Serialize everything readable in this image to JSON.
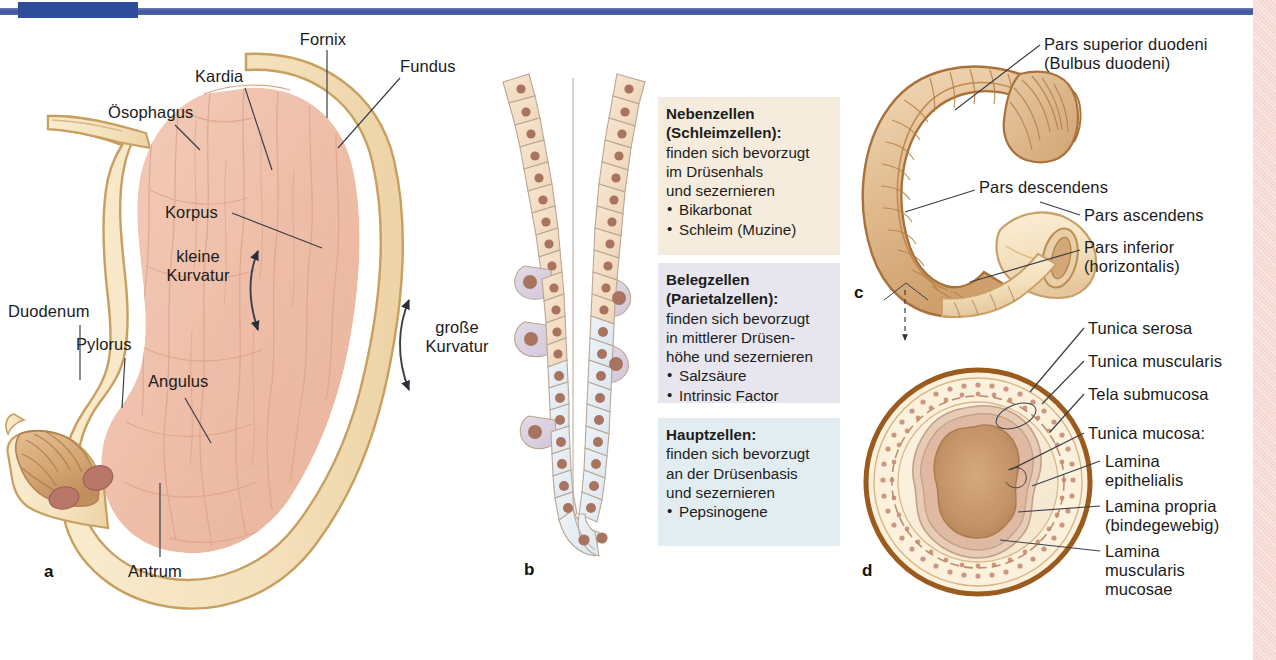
{
  "theme": {
    "header_bar_color": "#3d559c",
    "header_block_color": "#2f4c9a",
    "right_strip_color": "#f6d8d2",
    "wall_color": "#f6e3c2",
    "wall_outline": "#c8a163",
    "mucosa_color": "#f0c3ae",
    "duodenum_color": "#e0b488",
    "nebenzellen_box": "#f6ecdd",
    "belegzellen_box": "#e7e6ef",
    "hauptzellen_box": "#e2edf2",
    "chief_cell_fill": "#e6eef3",
    "parietal_cell_fill": "#ded7e4",
    "mucous_cell_fill": "#f5e0ca",
    "nucleus_color": "#a9745f",
    "serosa_brown": "#9b5a1e",
    "leader_color": "#3a3f4a"
  },
  "panel_a": {
    "letter": "a",
    "labels": {
      "fornix": "Fornix",
      "fundus": "Fundus",
      "kardia": "Kardia",
      "oesophagus": "Ösophagus",
      "korpus": "Korpus",
      "kleine_kurvatur": "kleine\nKurvatur",
      "grosse_kurvatur": "große\nKurvatur",
      "duodenum": "Duodenum",
      "pylorus": "Pylorus",
      "angulus": "Angulus",
      "antrum": "Antrum"
    }
  },
  "panel_b": {
    "letter": "b",
    "boxes": [
      {
        "id": "nebenzellen",
        "title": "Nebenzellen\n(Schleimzellen):",
        "body": "finden sich bevorzugt\nim Drüsenhals\nund sezernieren",
        "bullets": [
          "Bikarbonat",
          "Schleim (Muzine)"
        ],
        "bg": "#f6ecdd"
      },
      {
        "id": "belegzellen",
        "title": "Belegzellen\n(Parietalzellen):",
        "body": "finden sich bevorzugt\nin mittlerer Drüsen-\nhöhe und sezernieren",
        "bullets": [
          "Salzsäure",
          "Intrinsic Factor"
        ],
        "bg": "#e7e6ef"
      },
      {
        "id": "hauptzellen",
        "title": "Hauptzellen:",
        "body": "finden sich bevorzugt\nan der Drüsenbasis\nund sezernieren",
        "bullets": [
          "Pepsinogene"
        ],
        "bg": "#e2edf2"
      }
    ]
  },
  "panel_c": {
    "letter": "c",
    "labels": {
      "pars_superior": "Pars superior duodeni\n(Bulbus duodeni)",
      "pars_descendens": "Pars descendens",
      "pars_ascendens": "Pars ascendens",
      "pars_inferior": "Pars inferior\n(horizontalis)"
    }
  },
  "panel_d": {
    "letter": "d",
    "labels": {
      "tunica_serosa": "Tunica serosa",
      "tunica_muscularis": "Tunica muscularis",
      "tela_submucosa": "Tela submucosa",
      "tunica_mucosa": "Tunica mucosa:",
      "lamina_epithelialis": "Lamina\nepithelialis",
      "lamina_propria": "Lamina propria\n(bindegewebig)",
      "lamina_muscularis": "Lamina\nmuscularis\nmucosae"
    }
  }
}
